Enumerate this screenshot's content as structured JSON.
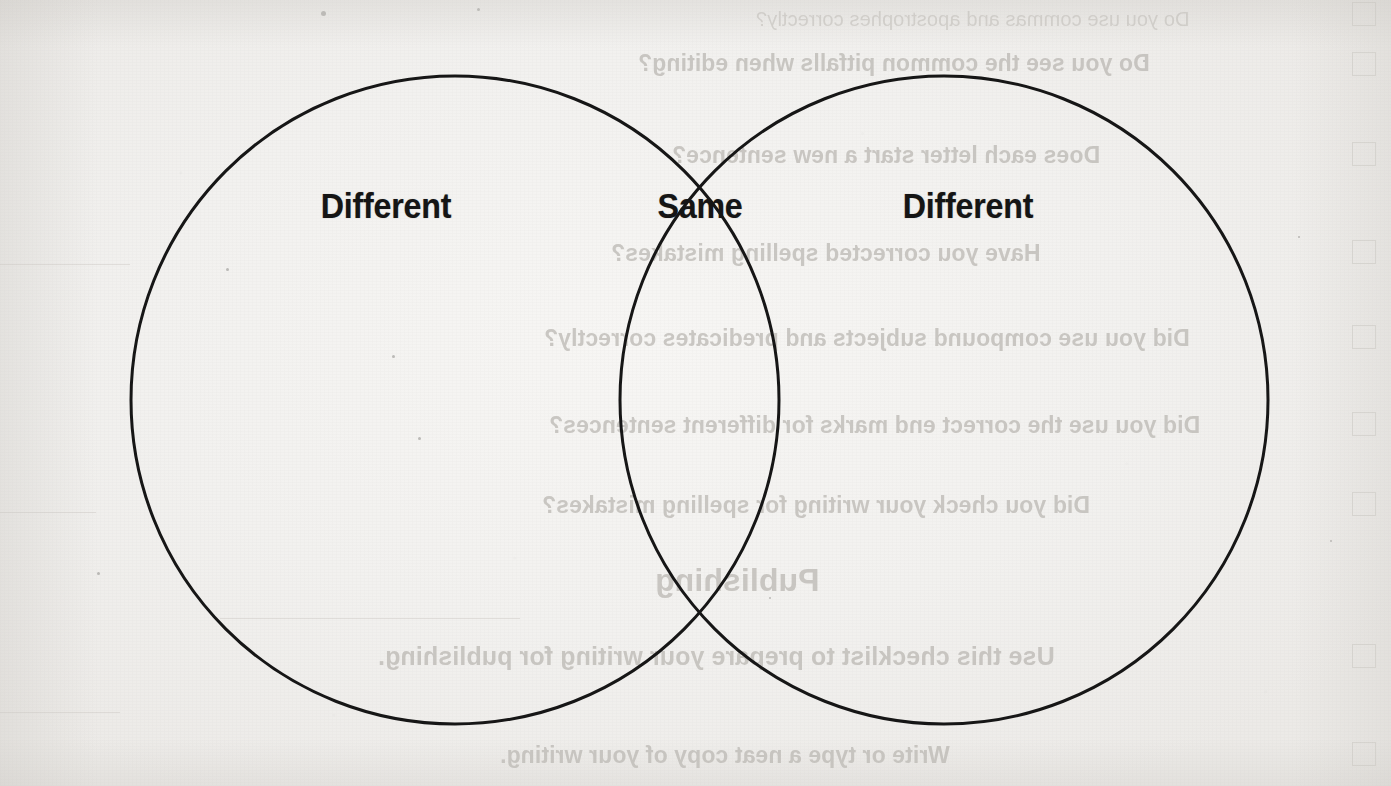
{
  "page": {
    "kind": "scanned-worksheet-page",
    "width": 1391,
    "height": 786,
    "paper_color": "#f3f2f0",
    "ink_color": "#151515",
    "showthrough_color": "#b9b6b1"
  },
  "diagram": {
    "type": "venn-diagram",
    "circle_count": 2,
    "stroke_color": "#161616",
    "stroke_width": 3,
    "labels": {
      "left": "Different",
      "middle": "Same",
      "right": "Different"
    },
    "circles": [
      {
        "name": "left-circle",
        "cx": 455,
        "cy": 400,
        "r": 324
      },
      {
        "name": "right-circle",
        "cx": 944,
        "cy": 400,
        "r": 324
      }
    ],
    "label_positions": [
      {
        "name": "left",
        "x": 386,
        "y": 206
      },
      {
        "name": "middle",
        "x": 700,
        "y": 206
      },
      {
        "name": "right",
        "x": 968,
        "y": 206
      }
    ]
  },
  "showthrough": {
    "description": "Mirrored text bleeding through from the reverse side of the sheet",
    "lines": [
      {
        "text": "Do you use commas and apostrophes correctly?",
        "x": 1190,
        "y": 8,
        "size": 20,
        "style": "thin"
      },
      {
        "text": "Do you see the common pitfalls when editing?",
        "x": 1150,
        "y": 50,
        "size": 23,
        "style": "bold"
      },
      {
        "text": "Does each letter start a new sentence?",
        "x": 1100,
        "y": 142,
        "size": 23,
        "style": "bold"
      },
      {
        "text": "Have you corrected spelling mistakes?",
        "x": 1040,
        "y": 240,
        "size": 23,
        "style": "bold"
      },
      {
        "text": "Did you use compound subjects and predicates correctly?",
        "x": 1190,
        "y": 325,
        "size": 23,
        "style": "bold"
      },
      {
        "text": "Did you use the correct end marks for different sentences?",
        "x": 1200,
        "y": 412,
        "size": 23,
        "style": "bold"
      },
      {
        "text": "Did you check your writing for spelling mistakes?",
        "x": 1090,
        "y": 492,
        "size": 23,
        "style": "bold"
      },
      {
        "text": "Publishing",
        "x": 820,
        "y": 562,
        "size": 32,
        "style": "bold"
      },
      {
        "text": "Use this checklist to prepare your writing for publishing.",
        "x": 1055,
        "y": 642,
        "size": 25,
        "style": "bold"
      },
      {
        "text": "Write or type a neat copy of your writing.",
        "x": 950,
        "y": 742,
        "size": 23,
        "style": "bold"
      }
    ],
    "checkboxes": [
      {
        "x": 1352,
        "y": 2
      },
      {
        "x": 1352,
        "y": 52
      },
      {
        "x": 1352,
        "y": 142
      },
      {
        "x": 1352,
        "y": 240
      },
      {
        "x": 1352,
        "y": 325
      },
      {
        "x": 1352,
        "y": 412
      },
      {
        "x": 1352,
        "y": 492
      },
      {
        "x": 1352,
        "y": 644
      },
      {
        "x": 1352,
        "y": 742
      }
    ],
    "rules": [
      {
        "x": 0,
        "y": 264,
        "w": 130
      },
      {
        "x": 0,
        "y": 512,
        "w": 96
      },
      {
        "x": 220,
        "y": 618,
        "w": 300
      },
      {
        "x": 0,
        "y": 712,
        "w": 120
      }
    ]
  },
  "specks": [
    {
      "x": 321,
      "y": 11,
      "d": 5
    },
    {
      "x": 477,
      "y": 8,
      "d": 3
    },
    {
      "x": 226,
      "y": 268,
      "d": 3
    },
    {
      "x": 392,
      "y": 355,
      "d": 3
    },
    {
      "x": 418,
      "y": 437,
      "d": 3
    },
    {
      "x": 1143,
      "y": 60,
      "d": 2
    },
    {
      "x": 1298,
      "y": 236,
      "d": 2
    },
    {
      "x": 769,
      "y": 597,
      "d": 2
    },
    {
      "x": 1330,
      "y": 540,
      "d": 2
    },
    {
      "x": 97,
      "y": 572,
      "d": 3
    }
  ]
}
